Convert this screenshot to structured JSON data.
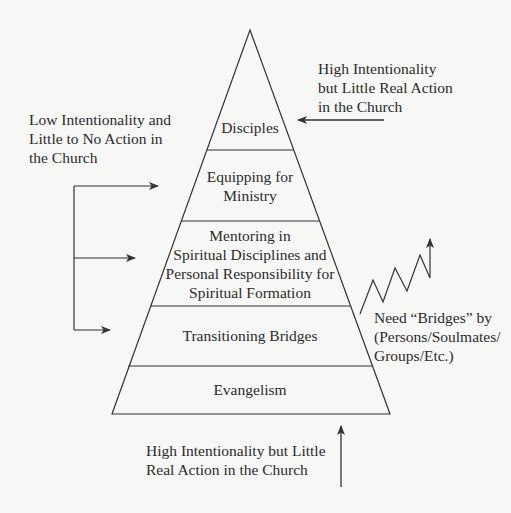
{
  "diagram": {
    "type": "pyramid",
    "colors": {
      "background": "#f7f7f5",
      "stroke": "#333333",
      "text": "#2b2b2b"
    },
    "levels": [
      {
        "id": "disciples",
        "lines": [
          "Disciples"
        ]
      },
      {
        "id": "equipping",
        "lines": [
          "Equipping for",
          "Ministry"
        ]
      },
      {
        "id": "mentoring",
        "lines": [
          "Mentoring in",
          "Spiritual Disciplines and",
          "Personal Responsibility for",
          "Spiritual Formation"
        ]
      },
      {
        "id": "transitioning",
        "lines": [
          "Transitioning Bridges"
        ]
      },
      {
        "id": "evangelism",
        "lines": [
          "Evangelism"
        ]
      }
    ],
    "annotations": {
      "top_right": {
        "lines": [
          "High Intentionality",
          "but Little Real Action",
          "in the Church"
        ],
        "arrow": "left",
        "points_to": "disciples"
      },
      "left": {
        "lines": [
          "Low Intentionality and",
          "Little to No Action in",
          "the Church"
        ],
        "arrow": "bracket-right",
        "points_to": [
          "equipping",
          "mentoring",
          "transitioning"
        ]
      },
      "right": {
        "lines": [
          "Need “Bridges” by",
          "(Persons/Soulmates/",
          "Groups/Etc.)"
        ],
        "arrow": "zigzag-up"
      },
      "bottom": {
        "lines": [
          "High Intentionality but Little",
          "Real Action in the Church"
        ],
        "arrow": "up"
      }
    }
  }
}
